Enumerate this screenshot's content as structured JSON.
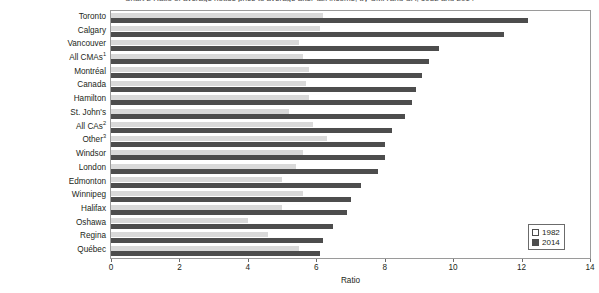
{
  "chart_data": {
    "type": "bar",
    "orientation": "horizontal",
    "title": "Chart 2 Ratio of average house price to average after-tax income, by CMA and CA, 1982 and 2014",
    "xlabel": "Ratio",
    "ylabel": "",
    "xlim": [
      0,
      14
    ],
    "xticks": [
      0,
      2,
      4,
      6,
      8,
      10,
      12,
      14
    ],
    "xtick_labels": [
      "0",
      "2",
      "4",
      "6",
      "8",
      "10",
      "12",
      "14"
    ],
    "grid": false,
    "legend_position": "bottom-right",
    "categories": [
      "Toronto",
      "Calgary",
      "Vancouver",
      "All CMAs",
      "Montréal",
      "Canada",
      "Hamilton",
      "St. John's",
      "All CAs",
      "Other",
      "Windsor",
      "London",
      "Edmonton",
      "Winnipeg",
      "Halifax",
      "Oshawa",
      "Regina",
      "Québec"
    ],
    "category_footnotes": {
      "All CMAs": "1",
      "All CAs": "2",
      "Other": "3"
    },
    "series": [
      {
        "name": "1982",
        "color": "#d9d9d9",
        "values": [
          6.2,
          6.1,
          5.5,
          5.6,
          5.8,
          5.7,
          5.8,
          5.2,
          5.9,
          6.3,
          5.6,
          5.4,
          5.0,
          5.6,
          5.0,
          4.0,
          4.6,
          5.5
        ]
      },
      {
        "name": "2014",
        "color": "#4d4d4d",
        "values": [
          12.2,
          11.5,
          9.6,
          9.3,
          9.1,
          8.9,
          8.8,
          8.6,
          8.2,
          8.0,
          8.0,
          7.8,
          7.3,
          7.0,
          6.9,
          6.5,
          6.2,
          6.1
        ]
      }
    ]
  },
  "legend": {
    "items": [
      {
        "label": "1982",
        "swatch": "light"
      },
      {
        "label": "2014",
        "swatch": "dark"
      }
    ]
  }
}
